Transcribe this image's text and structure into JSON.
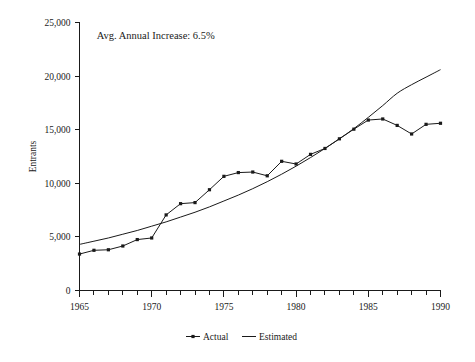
{
  "chart_data": {
    "type": "line",
    "title": "",
    "xlabel": "",
    "ylabel": "Entrants",
    "xlim": [
      1965,
      1990
    ],
    "ylim": [
      0,
      25000
    ],
    "grid": false,
    "legend_position": "bottom",
    "annotations": [
      {
        "text": "Avg. Annual Increase: 6.5%",
        "x": 1966.2,
        "y": 23500
      }
    ],
    "x": [
      1965,
      1966,
      1967,
      1968,
      1969,
      1970,
      1971,
      1972,
      1973,
      1974,
      1975,
      1976,
      1977,
      1978,
      1979,
      1980,
      1981,
      1982,
      1983,
      1984,
      1985,
      1986,
      1987,
      1988,
      1989,
      1990
    ],
    "series": [
      {
        "name": "Actual",
        "marker": "square",
        "values": [
          3400,
          3750,
          3800,
          4150,
          4750,
          4900,
          7050,
          8100,
          8200,
          9400,
          10650,
          11000,
          11050,
          10700,
          12050,
          11800,
          12700,
          13250,
          14150,
          15050,
          15900,
          16000,
          15400,
          14600,
          15500,
          15600
        ]
      },
      {
        "name": "Estimated",
        "marker": "none",
        "values": [
          4300,
          4600,
          4900,
          5250,
          5600,
          6000,
          6400,
          6850,
          7300,
          7800,
          8350,
          8900,
          9500,
          10150,
          10850,
          11600,
          12400,
          13250,
          14150,
          15100,
          16150,
          17250,
          18400,
          19200,
          19900,
          20600
        ]
      }
    ],
    "ytick_labels": [
      "0",
      "5,000",
      "10,000",
      "15,000",
      "20,000",
      "25,000"
    ],
    "ytick_values": [
      0,
      5000,
      10000,
      15000,
      20000,
      25000
    ],
    "xtick_labels": [
      "1965",
      "1970",
      "1975",
      "1980",
      "1985",
      "1990"
    ],
    "xtick_values": [
      1965,
      1970,
      1975,
      1980,
      1985,
      1990
    ],
    "xtick_minor_step": 1
  },
  "legend": {
    "items": [
      {
        "label": "Actual"
      },
      {
        "label": "Estimated"
      }
    ]
  },
  "colors": {
    "ink": "#1a1a1a",
    "background": "#ffffff"
  }
}
